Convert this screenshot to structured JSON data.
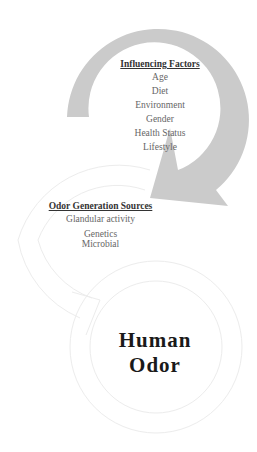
{
  "diagram": {
    "type": "cycle",
    "colors": {
      "primary_arrow": "#c9c9c9",
      "faint_arrow_stroke": "#ececec",
      "text_heading": "#333333",
      "text_item": "#666666",
      "center_text": "#1a1a1a"
    },
    "influencing_factors": {
      "heading": "Influencing Factors",
      "items": [
        "Age",
        "Diet",
        "Environment",
        "Gender",
        "Health Status",
        "Lifestyle"
      ]
    },
    "odor_generation_sources": {
      "heading": "Odor Generation Sources",
      "items": [
        "Glandular activity",
        "Genetics",
        "Microbial"
      ]
    },
    "center": {
      "line1": "Human",
      "line2": "Odor"
    }
  }
}
